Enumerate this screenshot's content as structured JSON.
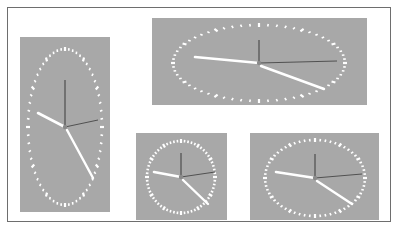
{
  "figure": {
    "colors": {
      "background": "#ffffff",
      "frame_border": "#6e6e6e",
      "panel": "#a8a8a8",
      "tick": "#ffffff",
      "hands_light": "#ffffff",
      "hands_dark": "#3a3a3a"
    },
    "clocks": [
      {
        "id": "tall-clock",
        "panel": {
          "x": 20,
          "y": 37,
          "w": 90,
          "h": 175
        },
        "center": {
          "x": 65,
          "y": 127
        },
        "radius": {
          "rx": 37,
          "ry": 78
        },
        "hour_hand": {
          "x": 38,
          "y": 113
        },
        "minute_hand": {
          "x": 93,
          "y": 178
        },
        "dark_hand_up": {
          "x": 65,
          "y": 80
        },
        "dark_hand_right": {
          "x": 98,
          "y": 120
        }
      },
      {
        "id": "wide-clock",
        "panel": {
          "x": 152,
          "y": 18,
          "w": 215,
          "h": 87
        },
        "center": {
          "x": 259,
          "y": 63
        },
        "radius": {
          "rx": 86,
          "ry": 38
        },
        "hour_hand": {
          "x": 195,
          "y": 57
        },
        "minute_hand": {
          "x": 324,
          "y": 89
        },
        "dark_hand_up": {
          "x": 259,
          "y": 40
        },
        "dark_hand_right": {
          "x": 337,
          "y": 61
        }
      },
      {
        "id": "square-clock",
        "panel": {
          "x": 136,
          "y": 133,
          "w": 91,
          "h": 87
        },
        "center": {
          "x": 181,
          "y": 177
        },
        "radius": {
          "rx": 34,
          "ry": 36
        },
        "hour_hand": {
          "x": 154,
          "y": 172
        },
        "minute_hand": {
          "x": 208,
          "y": 204
        },
        "dark_hand_up": {
          "x": 181,
          "y": 153
        },
        "dark_hand_right": {
          "x": 215,
          "y": 172
        }
      },
      {
        "id": "medium-clock",
        "panel": {
          "x": 250,
          "y": 133,
          "w": 129,
          "h": 87
        },
        "center": {
          "x": 315,
          "y": 178
        },
        "radius": {
          "rx": 50,
          "ry": 38
        },
        "hour_hand": {
          "x": 276,
          "y": 172
        },
        "minute_hand": {
          "x": 352,
          "y": 204
        },
        "dark_hand_up": {
          "x": 315,
          "y": 154
        },
        "dark_hand_right": {
          "x": 362,
          "y": 174
        }
      }
    ],
    "tick_count": 60
  }
}
